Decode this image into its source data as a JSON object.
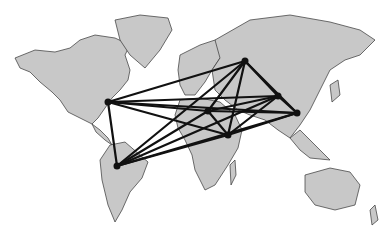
{
  "map": {
    "title": "World map network",
    "land_color": "#c8c8c8",
    "border_color": "#333333",
    "line_color": "#111111",
    "nodes": [
      {
        "id": "north-america",
        "x": 108,
        "y": 102
      },
      {
        "id": "south-america",
        "x": 117,
        "y": 166
      },
      {
        "id": "north-africa",
        "x": 208,
        "y": 111
      },
      {
        "id": "east-africa",
        "x": 228,
        "y": 135
      },
      {
        "id": "russia",
        "x": 245,
        "y": 61
      },
      {
        "id": "central-asia",
        "x": 278,
        "y": 96
      },
      {
        "id": "china",
        "x": 297,
        "y": 113
      }
    ]
  }
}
